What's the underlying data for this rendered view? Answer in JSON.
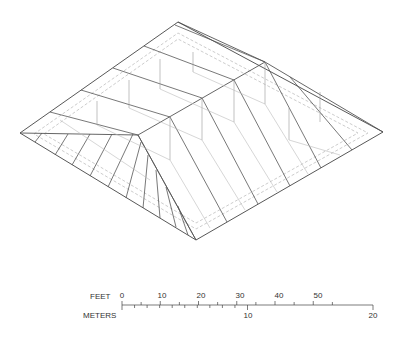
{
  "diagram": {
    "colors": {
      "outline": "#444444",
      "framing": "#666666",
      "hidden": "#bbbbbb",
      "dashed": "#aaaaaa"
    }
  },
  "scale_bar": {
    "feet_label": "FEET",
    "meters_label": "METERS",
    "feet_ticks": [
      "0",
      "10",
      "20",
      "30",
      "40",
      "50"
    ],
    "meters_ticks": [
      "10",
      "20"
    ]
  }
}
